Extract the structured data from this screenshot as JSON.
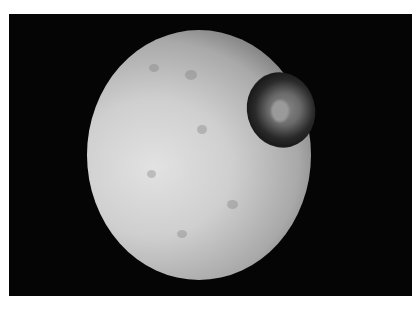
{
  "image": {
    "subject": "cratered moon",
    "description": "Grayscale photo of a heavily cratered moon with a large dark crater near its upper-right limb against a black background",
    "colors": {
      "background": "#050505",
      "page": "#ffffff",
      "surface_light": "#e2e2e2",
      "surface_dark": "#6e6e6e"
    }
  }
}
